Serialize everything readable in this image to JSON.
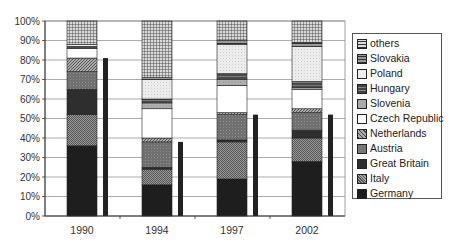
{
  "chart_data": {
    "type": "bar",
    "subtype": "stacked_percent_with_companion_bar",
    "title": "",
    "xlabel": "",
    "ylabel": "",
    "ylim": [
      0,
      100
    ],
    "y_ticks": [
      "0%",
      "10%",
      "20%",
      "30%",
      "40%",
      "50%",
      "60%",
      "70%",
      "80%",
      "90%",
      "100%"
    ],
    "grid": true,
    "legend_position": "right",
    "categories": [
      "1990",
      "1994",
      "1997",
      "2002"
    ],
    "series": [
      {
        "name": "Germany",
        "values": [
          36,
          16,
          19,
          28
        ],
        "color": "#1a1a1a"
      },
      {
        "name": "Italy",
        "values": [
          16,
          8,
          19,
          12
        ],
        "color": "#8c8c8c"
      },
      {
        "name": "Great Britain",
        "values": [
          13,
          1,
          1,
          4
        ],
        "color": "#2b2b2b"
      },
      {
        "name": "Austria",
        "values": [
          9,
          13,
          13,
          9
        ],
        "color": "#6e6e6e"
      },
      {
        "name": "Netherlands",
        "values": [
          7,
          2,
          1,
          2
        ],
        "color": "#9a9a9a"
      },
      {
        "name": "Czech Republic",
        "values": [
          5,
          15,
          14,
          10
        ],
        "color": "#ffffff"
      },
      {
        "name": "Slovenia",
        "values": [
          0,
          3,
          3,
          1
        ],
        "color": "#a8a8a8"
      },
      {
        "name": "Hungary",
        "values": [
          1,
          2,
          3,
          3
        ],
        "color": "#4a4a4a"
      },
      {
        "name": "Poland",
        "values": [
          1,
          10,
          15,
          18
        ],
        "color": "#e6e6e6"
      },
      {
        "name": "Slovakia",
        "values": [
          0,
          1,
          2,
          2
        ],
        "color": "#5c5c5c"
      },
      {
        "name": "others",
        "values": [
          12,
          29,
          10,
          11
        ],
        "color": "#b8b8b8"
      }
    ],
    "companion_bar": {
      "description": "thin dark bar to the right of each stacked column",
      "values": [
        81,
        38,
        52,
        52
      ],
      "color": "#222222"
    }
  },
  "legend": {
    "items": [
      "others",
      "Slovakia",
      "Poland",
      "Hungary",
      "Slovenia",
      "Czech Republic",
      "Netherlands",
      "Austria",
      "Great Britain",
      "Italy",
      "Germany"
    ]
  }
}
